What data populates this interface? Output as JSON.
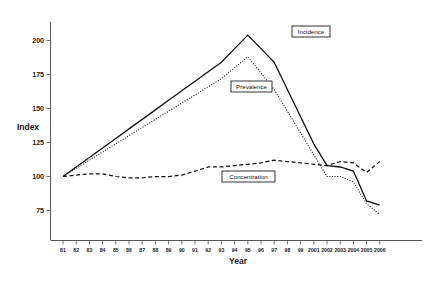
{
  "chart_data": {
    "type": "line",
    "title": "",
    "xlabel": "Year",
    "ylabel": "Index",
    "ylim": [
      62,
      212
    ],
    "yticks": [
      75,
      100,
      125,
      150,
      175,
      200
    ],
    "grid": false,
    "legend_position": "inline-labels",
    "categories": [
      "81",
      "82",
      "83",
      "84",
      "85",
      "86",
      "87",
      "88",
      "89",
      "90",
      "91",
      "92",
      "93",
      "94",
      "95",
      "96",
      "97",
      "98",
      "99",
      "2001",
      "2002",
      "2003",
      "2004",
      "2005",
      "2006"
    ],
    "series": [
      {
        "name": "Incidence",
        "style": "solid",
        "values": [
          100,
          107,
          114,
          121,
          128,
          135,
          142,
          149,
          156,
          163,
          170,
          177,
          184,
          194,
          204,
          194,
          184,
          164,
          144,
          124,
          108,
          107,
          104,
          82,
          79
        ]
      },
      {
        "name": "Prevalence",
        "style": "dotted",
        "values": [
          100,
          106,
          112,
          118,
          124,
          130,
          136,
          142,
          148,
          154,
          160,
          166,
          172,
          180,
          188,
          176,
          164,
          148,
          132,
          116,
          100,
          100,
          96,
          80,
          72
        ]
      },
      {
        "name": "Concentration",
        "style": "dashed",
        "values": [
          100,
          101,
          102,
          102,
          100,
          99,
          99,
          100,
          100,
          101,
          104,
          107,
          107,
          108,
          109,
          110,
          112,
          111,
          110,
          109,
          108,
          111,
          110,
          103,
          111
        ]
      }
    ]
  },
  "axes": {
    "y_axis_title": "Index",
    "x_axis_title": "Year"
  },
  "legend": {
    "incidence": "Incidence",
    "prevalence": "Prevalence",
    "concentration": "Concentration"
  },
  "colors": {
    "line": "#111111",
    "axis": "#555555",
    "text": "#1a1a1a",
    "background": "#ffffff"
  }
}
